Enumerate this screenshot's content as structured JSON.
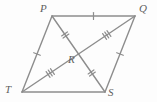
{
  "figure": {
    "shape_type": "parallelogram",
    "background_color": "#fdfdfd",
    "line_color": "#8d8d8d",
    "line_width": 1.4,
    "label_color": "#5f5f5f",
    "canvas": {
      "width": 157,
      "height": 102
    }
  },
  "vertices": [
    {
      "id": "P",
      "label": "P",
      "x": 52,
      "y": 16,
      "label_x": 40,
      "label_y": 3
    },
    {
      "id": "Q",
      "label": "Q",
      "x": 135,
      "y": 16,
      "label_x": 139,
      "label_y": 3
    },
    {
      "id": "S",
      "label": "S",
      "x": 105,
      "y": 92,
      "label_x": 108,
      "label_y": 87
    },
    {
      "id": "T",
      "label": "T",
      "x": 22,
      "y": 92,
      "label_x": 5,
      "label_y": 84
    },
    {
      "id": "R",
      "label": "R",
      "x": 78.5,
      "y": 54,
      "label_x": 68,
      "label_y": 54
    }
  ],
  "segments": [
    {
      "id": "PQ",
      "from": "P",
      "to": "Q",
      "kind": "side",
      "ticks": 1
    },
    {
      "id": "QS",
      "from": "Q",
      "to": "S",
      "kind": "side",
      "ticks": 1
    },
    {
      "id": "ST",
      "from": "S",
      "to": "T",
      "kind": "side",
      "ticks": 0
    },
    {
      "id": "TP",
      "from": "T",
      "to": "P",
      "kind": "side",
      "ticks": 1
    },
    {
      "id": "PR",
      "from": "P",
      "to": "R",
      "kind": "diagonal",
      "ticks": 2
    },
    {
      "id": "RS",
      "from": "R",
      "to": "S",
      "kind": "diagonal",
      "ticks": 2
    },
    {
      "id": "TR",
      "from": "T",
      "to": "R",
      "kind": "diagonal",
      "ticks": 3
    },
    {
      "id": "RQ",
      "from": "R",
      "to": "Q",
      "kind": "diagonal",
      "ticks": 3
    }
  ],
  "tick_style": {
    "length": 7,
    "spacing": 2.6,
    "width": 1.2,
    "color": "#8d8d8d"
  },
  "chart_data": {
    "type": "diagram",
    "points": {
      "P": [
        52,
        16
      ],
      "Q": [
        135,
        16
      ],
      "S": [
        105,
        92
      ],
      "T": [
        22,
        92
      ],
      "R": [
        78.5,
        54
      ]
    },
    "edges": [
      "PQ",
      "QS",
      "ST",
      "TP",
      "PS",
      "TQ"
    ],
    "congruence_marks": {
      "single": [
        "PQ",
        "QS",
        "TP"
      ],
      "double": [
        "PR",
        "RS"
      ],
      "triple": [
        "TR",
        "RQ"
      ]
    },
    "annotations": [
      "Diagonals PS and TQ intersect at point R",
      "PR = RS (double tick marks)",
      "TR = RQ (triple tick marks)"
    ]
  }
}
